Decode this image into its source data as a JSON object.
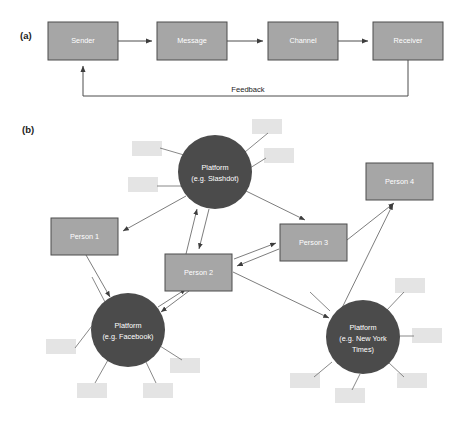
{
  "figure": {
    "width": 455,
    "height": 426,
    "background": "#ffffff"
  },
  "colors": {
    "box_fill": "#a6a6a6",
    "box_stroke": "#4d4d4d",
    "circle_fill": "#4b4b4b",
    "faded_fill": "#e4e4e4",
    "link_stroke": "#6e6e6e",
    "text_on_fill": "#ffffff",
    "text_dark": "#1b1b1b"
  },
  "panel_a": {
    "label": "(a)",
    "boxes": [
      {
        "id": "sender",
        "label": "Sender",
        "x": 48,
        "y": 22,
        "w": 70,
        "h": 38
      },
      {
        "id": "message",
        "label": "Message",
        "x": 157,
        "y": 22,
        "w": 70,
        "h": 38
      },
      {
        "id": "channel",
        "label": "Channel",
        "x": 268,
        "y": 22,
        "w": 70,
        "h": 38
      },
      {
        "id": "receiver",
        "label": "Receiver",
        "x": 373,
        "y": 22,
        "w": 70,
        "h": 38
      }
    ],
    "feedback_label": "Feedback",
    "flow": [
      {
        "from": "sender",
        "to": "message"
      },
      {
        "from": "message",
        "to": "channel"
      },
      {
        "from": "channel",
        "to": "receiver"
      },
      {
        "from": "receiver",
        "to": "sender",
        "label": "Feedback"
      }
    ]
  },
  "panel_b": {
    "label": "(b)",
    "boxes": [
      {
        "id": "person1",
        "label": "Person 1",
        "x": 51,
        "y": 218,
        "w": 67,
        "h": 37
      },
      {
        "id": "person2",
        "label": "Person 2",
        "x": 165,
        "y": 254,
        "w": 67,
        "h": 37
      },
      {
        "id": "person3",
        "label": "Person 3",
        "x": 280,
        "y": 224,
        "w": 67,
        "h": 37
      },
      {
        "id": "person4",
        "label": "Person 4",
        "x": 366,
        "y": 163,
        "w": 67,
        "h": 37
      }
    ],
    "circles": [
      {
        "id": "slashdot",
        "lines": [
          "Platform",
          "(e.g. Slashdot)"
        ],
        "cx": 215,
        "cy": 172,
        "r": 37
      },
      {
        "id": "facebook",
        "lines": [
          "Platform",
          "(e.g. Facebook)"
        ],
        "cx": 128,
        "cy": 330,
        "r": 37
      },
      {
        "id": "nytimes",
        "lines": [
          "Platform",
          "(e.g. New York",
          "Times)"
        ],
        "cx": 363,
        "cy": 337,
        "r": 37
      }
    ],
    "faded_boxes": [
      {
        "x": 132,
        "y": 141,
        "w": 30,
        "h": 15
      },
      {
        "x": 128,
        "y": 177,
        "w": 30,
        "h": 15
      },
      {
        "x": 252,
        "y": 119,
        "w": 30,
        "h": 15
      },
      {
        "x": 264,
        "y": 148,
        "w": 30,
        "h": 15
      },
      {
        "x": 46,
        "y": 339,
        "w": 30,
        "h": 15
      },
      {
        "x": 77,
        "y": 383,
        "w": 30,
        "h": 15
      },
      {
        "x": 143,
        "y": 383,
        "w": 30,
        "h": 15
      },
      {
        "x": 170,
        "y": 358,
        "w": 30,
        "h": 15
      },
      {
        "x": 395,
        "y": 278,
        "w": 30,
        "h": 15
      },
      {
        "x": 412,
        "y": 328,
        "w": 30,
        "h": 15
      },
      {
        "x": 397,
        "y": 373,
        "w": 30,
        "h": 15
      },
      {
        "x": 335,
        "y": 388,
        "w": 30,
        "h": 15
      },
      {
        "x": 290,
        "y": 373,
        "w": 30,
        "h": 15
      }
    ],
    "connections": [
      {
        "from": "slashdot",
        "to": "person1"
      },
      {
        "from": "person1",
        "to": "facebook"
      },
      {
        "from": "slashdot",
        "to": "person2"
      },
      {
        "from": "person2",
        "to": "slashdot"
      },
      {
        "from": "slashdot",
        "to": "person3"
      },
      {
        "from": "person3",
        "to": "person2"
      },
      {
        "from": "person2",
        "to": "person3"
      },
      {
        "from": "person2",
        "to": "facebook"
      },
      {
        "from": "facebook",
        "to": "person2"
      },
      {
        "from": "person2",
        "to": "nytimes"
      },
      {
        "from": "nytimes",
        "to": "person4"
      },
      {
        "from": "person3",
        "to": "person4"
      }
    ]
  }
}
